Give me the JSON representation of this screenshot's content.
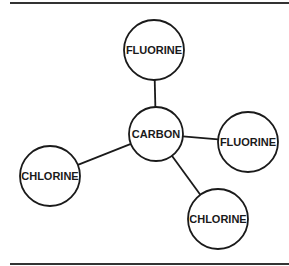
{
  "diagram": {
    "type": "molecule-structure",
    "center_atom": "CARBON",
    "nodes": [
      {
        "id": "fluorine_top",
        "label": "FLUORINE",
        "cx": 154,
        "cy": 50,
        "r": 30
      },
      {
        "id": "carbon",
        "label": "CARBON",
        "cx": 156,
        "cy": 134,
        "r": 27
      },
      {
        "id": "fluorine_right",
        "label": "FLUORINE",
        "cx": 248,
        "cy": 142,
        "r": 30
      },
      {
        "id": "chlorine_left",
        "label": "CHLORINE",
        "cx": 50,
        "cy": 176,
        "r": 30
      },
      {
        "id": "chlorine_bottom",
        "label": "CHLORINE",
        "cx": 218,
        "cy": 219,
        "r": 30
      }
    ],
    "edges": [
      {
        "from": "carbon",
        "to": "fluorine_top"
      },
      {
        "from": "carbon",
        "to": "fluorine_right"
      },
      {
        "from": "carbon",
        "to": "chlorine_left"
      },
      {
        "from": "carbon",
        "to": "chlorine_bottom"
      }
    ],
    "colors": {
      "stroke": "#1a1a1a",
      "fill": "#ffffff",
      "rule": "#333333"
    }
  }
}
